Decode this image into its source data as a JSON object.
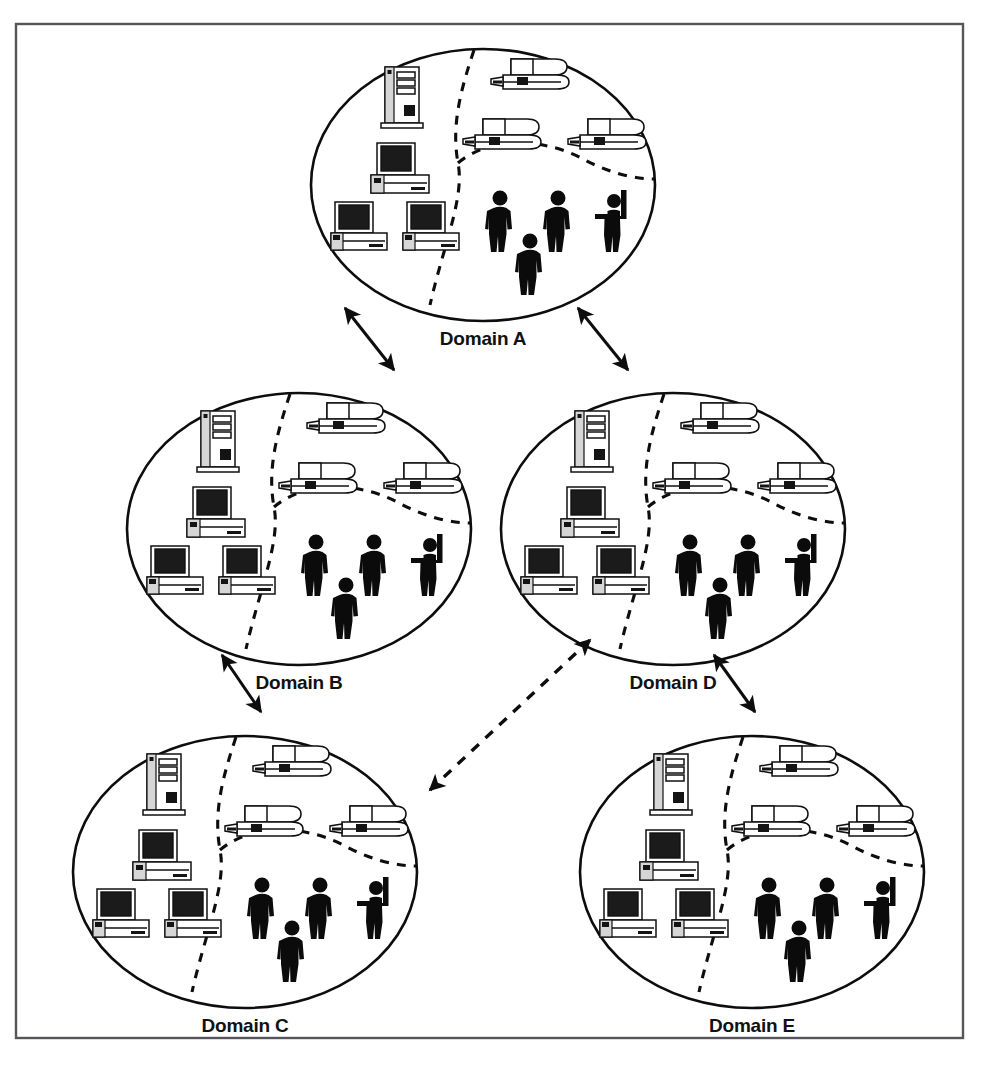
{
  "figure": {
    "frame": {
      "border_color": "#55555a",
      "background": "#ffffff"
    },
    "ink_color": "#0d0d0d"
  },
  "domains": [
    {
      "id": "a",
      "label": "Domain A",
      "cx": 483,
      "cy": 185,
      "rx": 172,
      "ry": 136,
      "label_x": 483,
      "label_y": 345
    },
    {
      "id": "b",
      "label": "Domain B",
      "cx": 299,
      "cy": 529,
      "rx": 172,
      "ry": 136,
      "label_x": 299,
      "label_y": 689
    },
    {
      "id": "d",
      "label": "Domain D",
      "cx": 673,
      "cy": 529,
      "rx": 172,
      "ry": 136,
      "label_x": 673,
      "label_y": 689
    },
    {
      "id": "c",
      "label": "Domain C",
      "cx": 245,
      "cy": 872,
      "rx": 172,
      "ry": 136,
      "label_x": 245,
      "label_y": 1032
    },
    {
      "id": "e",
      "label": "Domain E",
      "cx": 752,
      "cy": 872,
      "rx": 172,
      "ry": 136,
      "label_x": 752,
      "label_y": 1032
    }
  ],
  "connections": [
    {
      "id": "a-b",
      "from": "Domain A",
      "to": "Domain B",
      "style": "solid",
      "x1": 394,
      "y1": 370,
      "x2": 345,
      "y2": 308
    },
    {
      "id": "a-d",
      "from": "Domain A",
      "to": "Domain D",
      "style": "solid",
      "x1": 578,
      "y1": 308,
      "x2": 628,
      "y2": 370
    },
    {
      "id": "b-c",
      "from": "Domain B",
      "to": "Domain C",
      "style": "solid",
      "x1": 261,
      "y1": 712,
      "x2": 222,
      "y2": 655
    },
    {
      "id": "d-e",
      "from": "Domain D",
      "to": "Domain E",
      "style": "solid",
      "x1": 714,
      "y1": 655,
      "x2": 755,
      "y2": 712
    },
    {
      "id": "d-c",
      "from": "Domain D",
      "to": "Domain C",
      "style": "dashed",
      "x1": 430,
      "y1": 790,
      "x2": 590,
      "y2": 640
    }
  ],
  "domain_contents": {
    "description": "Each domain ellipse contains three dash-partitioned zones: a server/workstation zone, a laptop zone, and a people zone.",
    "zones": [
      {
        "name": "computers-zone",
        "position": "left"
      },
      {
        "name": "laptops-zone",
        "position": "upper-right"
      },
      {
        "name": "people-zone",
        "position": "lower-right"
      }
    ],
    "icons": [
      {
        "name": "server-tower-icon",
        "count": 1,
        "zone": "computers-zone"
      },
      {
        "name": "desktop-computer-icon",
        "count": 1,
        "zone": "computers-zone"
      },
      {
        "name": "workstation-icon",
        "count": 2,
        "zone": "computers-zone"
      },
      {
        "name": "laptop-icon",
        "count": 3,
        "zone": "laptops-zone"
      },
      {
        "name": "person-icon",
        "count": 3,
        "zone": "people-zone"
      },
      {
        "name": "person-raised-arm-icon",
        "count": 1,
        "zone": "people-zone"
      }
    ]
  }
}
